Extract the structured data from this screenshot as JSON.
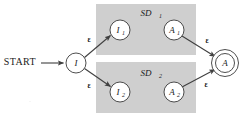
{
  "figure": {
    "type": "nfa-state-diagram",
    "title": "",
    "background_color": "#ffffff",
    "region_color": "#cfcfcf",
    "stroke_color": "#3f3f3f"
  },
  "labels": {
    "start": "START",
    "epsilon": "ε"
  },
  "regions": [
    {
      "id": "sd1",
      "label": "SD",
      "subscript": "1",
      "x": 96,
      "y": 4,
      "width": 100,
      "height": 51
    },
    {
      "id": "sd2",
      "label": "SD",
      "subscript": "2",
      "x": 96,
      "y": 62,
      "width": 100,
      "height": 51
    }
  ],
  "nodes": [
    {
      "id": "I",
      "label": "I",
      "subscript": "",
      "cx": 76,
      "cy": 63,
      "r": 10,
      "accepting": false
    },
    {
      "id": "I1",
      "label": "I",
      "subscript": "1",
      "cx": 120,
      "cy": 30,
      "r": 10,
      "accepting": false
    },
    {
      "id": "A1",
      "label": "A",
      "subscript": "1",
      "cx": 174,
      "cy": 30,
      "r": 10,
      "accepting": false
    },
    {
      "id": "I2",
      "label": "I",
      "subscript": "2",
      "cx": 120,
      "cy": 92,
      "r": 10,
      "accepting": false
    },
    {
      "id": "A2",
      "label": "A",
      "subscript": "2",
      "cx": 174,
      "cy": 92,
      "r": 10,
      "accepting": false
    },
    {
      "id": "A",
      "label": "A",
      "subscript": "",
      "cx": 225,
      "cy": 63,
      "r": 10,
      "accepting": true
    }
  ],
  "edges": [
    {
      "id": "start-to-I",
      "from": "START",
      "to": "I",
      "label": "",
      "label_x": 0,
      "label_y": 0
    },
    {
      "id": "I-to-I1",
      "from": "I",
      "to": "I1",
      "label": "ε",
      "label_x": 89,
      "label_y": 40
    },
    {
      "id": "I-to-I2",
      "from": "I",
      "to": "I2",
      "label": "ε",
      "label_x": 89,
      "label_y": 86
    },
    {
      "id": "A1-to-A",
      "from": "A1",
      "to": "A",
      "label": "ε",
      "label_x": 207,
      "label_y": 41
    },
    {
      "id": "A2-to-A",
      "from": "A2",
      "to": "A",
      "label": "ε",
      "label_x": 206,
      "label_y": 85
    }
  ]
}
